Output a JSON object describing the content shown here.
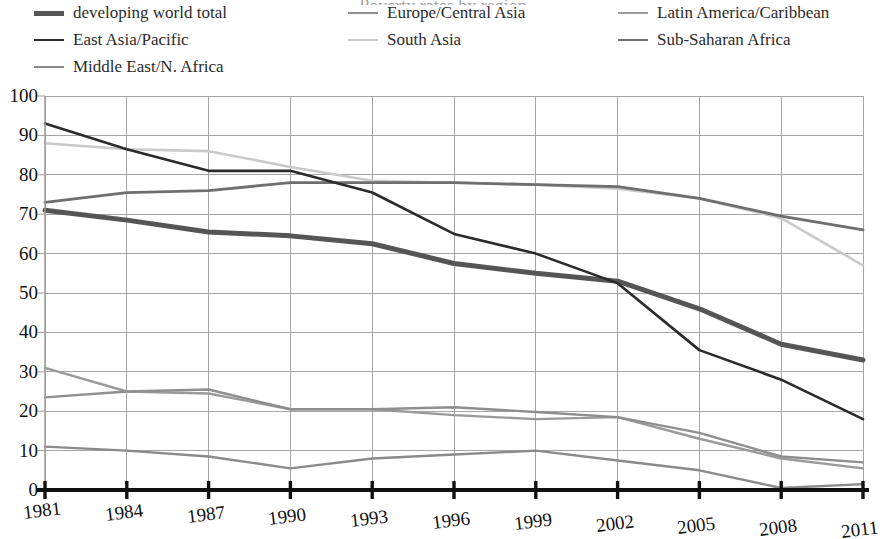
{
  "figure": {
    "faint_cropped_title": "Poverty rates by region",
    "legend_position": "top",
    "columns": 3
  },
  "legend": {
    "items": [
      {
        "label": "developing world total",
        "color": "#555555",
        "width": 5.0,
        "col": 0,
        "row": 0
      },
      {
        "label": "East Asia/Pacific",
        "color": "#2b2b2b",
        "width": 2.6,
        "col": 0,
        "row": 1
      },
      {
        "label": "Middle East/N. Africa",
        "color": "#8a8a8a",
        "width": 2.4,
        "col": 0,
        "row": 2
      },
      {
        "label": "Europe/Central Asia",
        "color": "#8e8e8e",
        "width": 2.4,
        "col": 1,
        "row": 0
      },
      {
        "label": "South Asia",
        "color": "#c9c9c9",
        "width": 2.6,
        "col": 1,
        "row": 1
      },
      {
        "label": "Latin America/Caribbean",
        "color": "#9a9a9a",
        "width": 2.4,
        "col": 2,
        "row": 0
      },
      {
        "label": "Sub-Saharan Africa",
        "color": "#6e6e6e",
        "width": 2.8,
        "col": 2,
        "row": 1
      }
    ]
  },
  "axes": {
    "y_ticks": [
      "0",
      "10",
      "20",
      "30",
      "40",
      "50",
      "60",
      "70",
      "80",
      "90",
      "100"
    ],
    "x_ticks": [
      "1981",
      "1984",
      "1987",
      "1990",
      "1993",
      "1996",
      "1999",
      "2002",
      "2005",
      "2008",
      "2011"
    ],
    "ylim": [
      0,
      100
    ],
    "grid": true,
    "axis_color": "#111111",
    "grid_color": "#9b9b9b"
  },
  "chart_data": {
    "type": "line",
    "title": "",
    "xlabel": "",
    "ylabel": "",
    "ylim": [
      0,
      100
    ],
    "grid": true,
    "legend_position": "top",
    "x": [
      1981,
      1984,
      1987,
      1990,
      1993,
      1996,
      1999,
      2002,
      2005,
      2008,
      2011
    ],
    "series": [
      {
        "name": "developing world total",
        "color": "#555555",
        "width": 5.0,
        "values": [
          71,
          68.5,
          65.5,
          64.5,
          62.5,
          57.5,
          55,
          53,
          46,
          37,
          33
        ]
      },
      {
        "name": "East Asia/Pacific",
        "color": "#2b2b2b",
        "width": 2.6,
        "values": [
          93,
          86.5,
          81,
          81,
          75.5,
          65,
          60,
          52.5,
          35.5,
          28,
          18
        ]
      },
      {
        "name": "Middle East/N. Africa",
        "color": "#8a8a8a",
        "width": 2.4,
        "values": [
          11,
          10,
          8.5,
          5.5,
          8,
          9,
          10,
          7.5,
          5,
          0.5,
          1.5
        ]
      },
      {
        "name": "Europe/Central Asia",
        "color": "#8e8e8e",
        "width": 2.4,
        "values": [
          23.5,
          25,
          25.5,
          20.5,
          20.5,
          21,
          19.8,
          18.5,
          14.5,
          8.5,
          7
        ]
      },
      {
        "name": "South Asia",
        "color": "#c9c9c9",
        "width": 2.6,
        "values": [
          88,
          86.5,
          86,
          82,
          78.5,
          78,
          77.5,
          76.5,
          74,
          69,
          57
        ]
      },
      {
        "name": "Latin America/Caribbean",
        "color": "#9a9a9a",
        "width": 2.4,
        "values": [
          31,
          25,
          24.5,
          20.5,
          20.5,
          19,
          18,
          18.5,
          13,
          8,
          5.5
        ]
      },
      {
        "name": "Sub-Saharan Africa",
        "color": "#6e6e6e",
        "width": 2.8,
        "values": [
          73,
          75.5,
          76,
          78,
          78,
          78,
          77.5,
          77,
          74,
          69.5,
          66
        ]
      }
    ]
  }
}
